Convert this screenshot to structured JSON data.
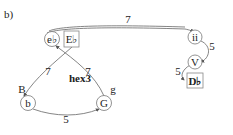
{
  "panel_label": "b)",
  "center_label": "hex3",
  "nodes": {
    "eflat": "e♭",
    "Eflat": "E♭",
    "ii": "ii",
    "V": "V",
    "Dflat": "D♭",
    "b": "b",
    "G": "G"
  },
  "edges": {
    "eflat_ii": "7",
    "ii_V": "5",
    "V_Dflat": "5",
    "Eflat_b": "7",
    "G_eflat": "7",
    "b_G": "5"
  },
  "side_labels": {
    "left": "B",
    "right": "g"
  }
}
